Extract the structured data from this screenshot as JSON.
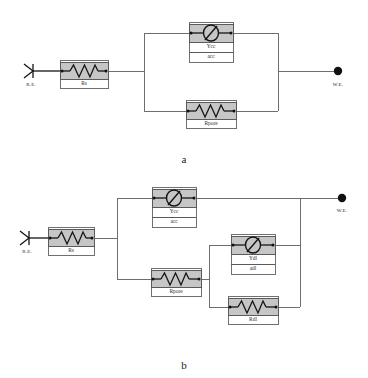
{
  "figure": {
    "captions": [
      {
        "id": "caption-a",
        "text": "a"
      },
      {
        "id": "caption-b",
        "text": "b"
      }
    ]
  },
  "terminals": {
    "reference_label": "R.E.",
    "working_label": "W.E."
  },
  "circuit_a": {
    "name": "a",
    "terminals": {
      "left": "R.E.",
      "right": "W.E."
    },
    "components": [
      {
        "id": "rs-a",
        "type": "resistor",
        "label": "Rs"
      },
      {
        "id": "ycc-a",
        "type": "cpe",
        "label_top": "Ycc",
        "label_bottom": "acc",
        "symbol": "Ø"
      },
      {
        "id": "rpore-a",
        "type": "resistor",
        "label": "Rpore"
      }
    ]
  },
  "circuit_b": {
    "name": "b",
    "terminals": {
      "left": "R.E.",
      "right": "W.E."
    },
    "components": [
      {
        "id": "rs-b",
        "type": "resistor",
        "label": "Rs"
      },
      {
        "id": "ycc-b",
        "type": "cpe",
        "label_top": "Ycc",
        "label_bottom": "acc",
        "symbol": "Ø"
      },
      {
        "id": "rpore-b",
        "type": "resistor",
        "label": "Rpore"
      },
      {
        "id": "ydl-b",
        "type": "cpe",
        "label_top": "Ydl",
        "label_bottom": "adl",
        "symbol": "Ø"
      },
      {
        "id": "rdl-b",
        "type": "resistor",
        "label": "Rdl"
      }
    ]
  },
  "colors": {
    "wire": "#6e6e6e",
    "component_fill": "#c6c6c6",
    "component_stroke": "#5a5a5a",
    "symbol_stroke": "#151515",
    "background": "#ffffff"
  }
}
